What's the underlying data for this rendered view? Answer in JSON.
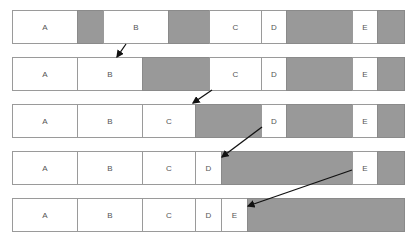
{
  "diagram": {
    "title": "",
    "colors": {
      "block": "#ffffff",
      "free": "#999999",
      "border": "#9a9a9a",
      "arrow": "#111111"
    },
    "rows": [
      {
        "top": 10,
        "segments": [
          {
            "x": 12,
            "w": 65,
            "type": "block",
            "label": "A"
          },
          {
            "x": 77,
            "w": 26,
            "type": "free",
            "label": ""
          },
          {
            "x": 103,
            "w": 65,
            "type": "block",
            "label": "B"
          },
          {
            "x": 168,
            "w": 41,
            "type": "free",
            "label": ""
          },
          {
            "x": 209,
            "w": 52,
            "type": "block",
            "label": "C"
          },
          {
            "x": 261,
            "w": 25,
            "type": "block",
            "label": "D"
          },
          {
            "x": 286,
            "w": 66,
            "type": "free",
            "label": ""
          },
          {
            "x": 352,
            "w": 25,
            "type": "block",
            "label": "E"
          },
          {
            "x": 377,
            "w": 27,
            "type": "free",
            "label": ""
          }
        ]
      },
      {
        "top": 57,
        "segments": [
          {
            "x": 12,
            "w": 65,
            "type": "block",
            "label": "A"
          },
          {
            "x": 77,
            "w": 65,
            "type": "block",
            "label": "B"
          },
          {
            "x": 142,
            "w": 67,
            "type": "free",
            "label": ""
          },
          {
            "x": 209,
            "w": 52,
            "type": "block",
            "label": "C"
          },
          {
            "x": 261,
            "w": 25,
            "type": "block",
            "label": "D"
          },
          {
            "x": 286,
            "w": 66,
            "type": "free",
            "label": ""
          },
          {
            "x": 352,
            "w": 25,
            "type": "block",
            "label": "E"
          },
          {
            "x": 377,
            "w": 27,
            "type": "free",
            "label": ""
          }
        ]
      },
      {
        "top": 104,
        "segments": [
          {
            "x": 12,
            "w": 65,
            "type": "block",
            "label": "A"
          },
          {
            "x": 77,
            "w": 65,
            "type": "block",
            "label": "B"
          },
          {
            "x": 142,
            "w": 53,
            "type": "block",
            "label": "C"
          },
          {
            "x": 195,
            "w": 66,
            "type": "free",
            "label": ""
          },
          {
            "x": 261,
            "w": 25,
            "type": "block",
            "label": "D"
          },
          {
            "x": 286,
            "w": 66,
            "type": "free",
            "label": ""
          },
          {
            "x": 352,
            "w": 25,
            "type": "block",
            "label": "E"
          },
          {
            "x": 377,
            "w": 27,
            "type": "free",
            "label": ""
          }
        ]
      },
      {
        "top": 151,
        "segments": [
          {
            "x": 12,
            "w": 65,
            "type": "block",
            "label": "A"
          },
          {
            "x": 77,
            "w": 65,
            "type": "block",
            "label": "B"
          },
          {
            "x": 142,
            "w": 53,
            "type": "block",
            "label": "C"
          },
          {
            "x": 195,
            "w": 26,
            "type": "block",
            "label": "D"
          },
          {
            "x": 221,
            "w": 131,
            "type": "free",
            "label": ""
          },
          {
            "x": 352,
            "w": 25,
            "type": "block",
            "label": "E"
          },
          {
            "x": 377,
            "w": 27,
            "type": "free",
            "label": ""
          }
        ]
      },
      {
        "top": 198,
        "segments": [
          {
            "x": 12,
            "w": 65,
            "type": "block",
            "label": "A"
          },
          {
            "x": 77,
            "w": 65,
            "type": "block",
            "label": "B"
          },
          {
            "x": 142,
            "w": 53,
            "type": "block",
            "label": "C"
          },
          {
            "x": 195,
            "w": 26,
            "type": "block",
            "label": "D"
          },
          {
            "x": 221,
            "w": 26,
            "type": "block",
            "label": "E"
          },
          {
            "x": 247,
            "w": 157,
            "type": "free",
            "label": ""
          }
        ]
      }
    ],
    "arrows": [
      {
        "from": [
          126,
          44
        ],
        "to": [
          117,
          57
        ],
        "desc": "B moves left"
      },
      {
        "from": [
          212,
          90
        ],
        "to": [
          193,
          103
        ],
        "desc": "C moves left"
      },
      {
        "from": [
          262,
          127
        ],
        "to": [
          222,
          157
        ],
        "desc": "D moves left"
      },
      {
        "from": [
          352,
          170
        ],
        "to": [
          248,
          206
        ],
        "desc": "E moves left"
      }
    ]
  }
}
